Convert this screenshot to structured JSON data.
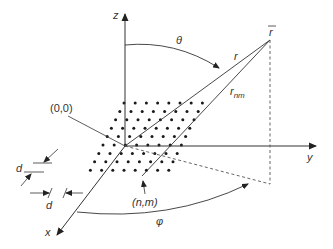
{
  "diagram": {
    "type": "3d-coordinate-geometry",
    "axes": {
      "z": "z",
      "y": "y",
      "x": "x"
    },
    "labels": {
      "origin": "(0,0)",
      "element": "(n,m)",
      "spacing_vertical": "d",
      "spacing_horizontal": "d",
      "theta": "θ",
      "phi": "φ",
      "r": "r",
      "r_vector": "r",
      "r_nm_base": "r",
      "r_nm_sub": "nm"
    },
    "colors": {
      "line": "#333333",
      "dot": "#1a1a1a",
      "dashed": "#555555"
    },
    "grid": {
      "rows": 9,
      "cols": 13,
      "row_dx": -4.2,
      "row_dy": 8.4,
      "col_dx": 11.2
    }
  }
}
